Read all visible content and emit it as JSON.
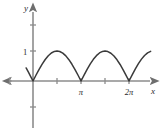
{
  "figure": {
    "background_color": "#ffffff",
    "axis_color": "#8c8c8c",
    "curve_color": "#3a3a3a",
    "text_color": "#2b2b2b"
  },
  "chart_data": {
    "type": "line",
    "title": "",
    "subtitle": "",
    "xlabel": "x",
    "ylabel": "y",
    "function": "y = |sin x|",
    "grid": false,
    "legend": null,
    "xlim": [
      -0.5,
      7.75
    ],
    "ylim": [
      -1.45,
      1.55
    ],
    "x_ticks": [
      {
        "value": 1.5708,
        "label": ""
      },
      {
        "value": 3.1416,
        "label": "π"
      },
      {
        "value": 4.7124,
        "label": ""
      },
      {
        "value": 6.2832,
        "label": "2π"
      }
    ],
    "x_ticks_negative": [
      {
        "value": -1.5708,
        "label": ""
      }
    ],
    "y_ticks": [
      {
        "value": 1,
        "label": "1"
      }
    ],
    "y_ticks_unlabeled": [
      {
        "value": 1.8,
        "label": ""
      },
      {
        "value": -1.0,
        "label": ""
      }
    ],
    "x": [
      -0.45,
      -0.3,
      -0.15,
      0.0,
      0.2,
      0.4,
      0.6,
      0.8,
      1.0,
      1.2,
      1.4,
      1.5708,
      1.75,
      1.95,
      2.15,
      2.35,
      2.55,
      2.75,
      2.95,
      3.1416,
      3.35,
      3.55,
      3.75,
      3.95,
      4.15,
      4.35,
      4.55,
      4.7124,
      4.9,
      5.1,
      5.3,
      5.5,
      5.7,
      5.9,
      6.1,
      6.2832,
      6.5,
      6.7,
      6.9,
      7.1,
      7.3,
      7.5,
      7.7
    ],
    "y": [
      0.435,
      0.296,
      0.149,
      0.0,
      0.199,
      0.389,
      0.565,
      0.717,
      0.841,
      0.932,
      0.985,
      1.0,
      0.984,
      0.929,
      0.837,
      0.711,
      0.558,
      0.382,
      0.191,
      0.0,
      0.206,
      0.396,
      0.572,
      0.722,
      0.845,
      0.935,
      0.987,
      1.0,
      0.982,
      0.926,
      0.832,
      0.706,
      0.551,
      0.374,
      0.182,
      0.0,
      0.215,
      0.405,
      0.58,
      0.729,
      0.85,
      0.938,
      0.988
    ],
    "annotations": []
  }
}
